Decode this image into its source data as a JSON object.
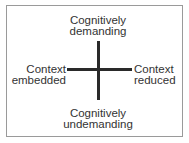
{
  "diagram": {
    "top": {
      "line1": "Cognitively",
      "line2": "demanding"
    },
    "bottom": {
      "line1": "Cognitively",
      "line2": "undemanding"
    },
    "left": {
      "line1": "Context",
      "line2": "embedded"
    },
    "right": {
      "line1": "Context",
      "line2": "reduced"
    }
  }
}
